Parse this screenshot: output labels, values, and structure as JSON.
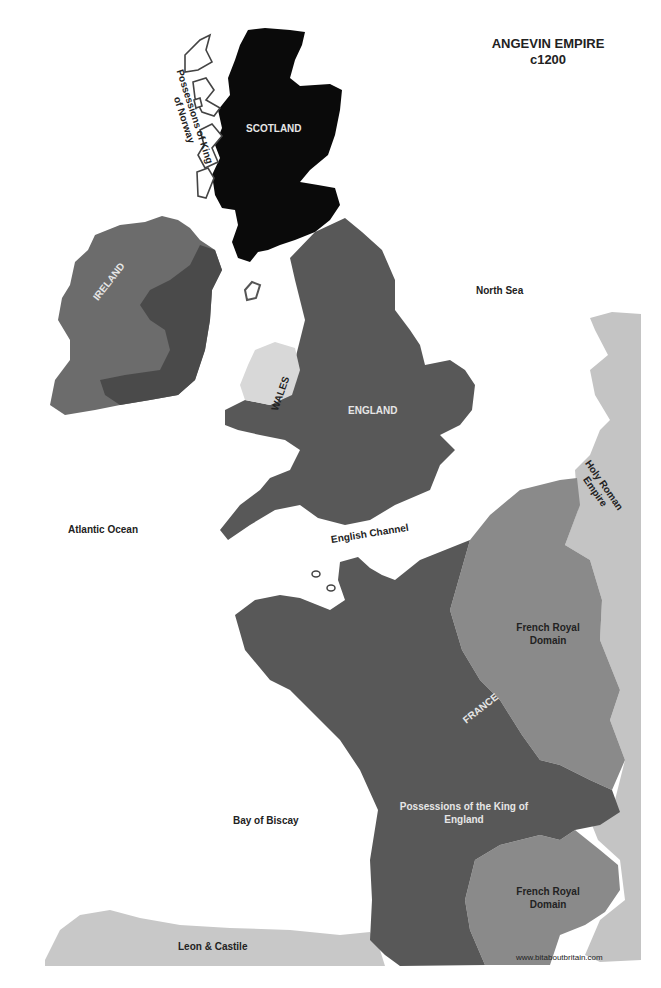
{
  "title": {
    "line1": "ANGEVIN EMPIRE",
    "line2": "c1200"
  },
  "colors": {
    "background": "#ffffff",
    "scotland": "#0a0a0a",
    "england_possessions": "#585858",
    "ireland_anglo": "#4a4a4a",
    "ireland_gaelic": "#6c6c6c",
    "wales": "#d8d8d8",
    "french_royal_domain": "#8a8a8a",
    "holy_roman_empire": "#c4c4c4",
    "leon_castile": "#c8c8c8",
    "norway_outline": "#555555"
  },
  "regions": {
    "scotland": "SCOTLAND",
    "norway": "Possessions of King of Norway",
    "norway_line1": "Possessions of King",
    "norway_line2": "of Norway",
    "ireland": "IRELAND",
    "wales": "WALES",
    "england": "ENGLAND",
    "france": "FRANCE",
    "holy_roman_empire_line1": "Holy Roman",
    "holy_roman_empire_line2": "Empire",
    "french_royal_domain_north_line1": "French Royal",
    "french_royal_domain_north_line2": "Domain",
    "possessions_king_england_line1": "Possessions of the King of",
    "possessions_king_england_line2": "England",
    "french_royal_domain_south_line1": "French Royal",
    "french_royal_domain_south_line2": "Domain",
    "leon_castile": "Leon & Castile"
  },
  "seas": {
    "north_sea": "North Sea",
    "atlantic_ocean": "Atlantic Ocean",
    "english_channel": "English Channel",
    "bay_of_biscay": "Bay of Biscay"
  },
  "credit": "www.bitaboutbritain.com"
}
